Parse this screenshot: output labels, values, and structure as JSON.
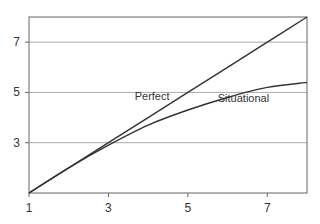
{
  "chart_data": {
    "type": "line",
    "title": "",
    "xlabel": "",
    "ylabel": "",
    "xlim": [
      1,
      8
    ],
    "ylim": [
      1,
      8
    ],
    "xticks": [
      1,
      3,
      5,
      7
    ],
    "yticks": [
      3,
      5,
      7
    ],
    "xtick_labels": [
      "1",
      "3",
      "5",
      "7"
    ],
    "ytick_labels": [
      "3",
      "5",
      "7"
    ],
    "grid": "horizontal",
    "series": [
      {
        "name": "Perfect",
        "x": [
          1,
          2,
          3,
          4,
          5,
          6,
          7,
          8
        ],
        "y": [
          1,
          2,
          3,
          4,
          5,
          6,
          7,
          8
        ]
      },
      {
        "name": "Situational",
        "x": [
          1,
          2,
          3,
          4,
          5,
          6,
          7,
          8
        ],
        "y": [
          1,
          2.0,
          2.9,
          3.7,
          4.3,
          4.8,
          5.2,
          5.4
        ]
      }
    ],
    "annotations": [
      {
        "text": "Perfect",
        "x": 4.1,
        "y": 4.7
      },
      {
        "text": "Situational",
        "x": 6.4,
        "y": 4.6
      }
    ],
    "colors": {
      "line": "#333333",
      "grid": "#aaaaaa",
      "frame": "#666666"
    }
  }
}
